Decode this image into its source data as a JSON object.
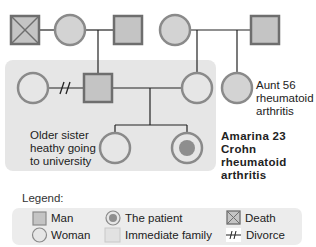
{
  "colors": {
    "fill": "#d3d3d3",
    "stroke": "#8a8a8a",
    "dark_stroke": "#6e6e6e",
    "line": "#222222",
    "family_box": "#e6e6e6",
    "legend_box": "#ececec",
    "patient_dot": "#8e8e8e"
  },
  "diagram": {
    "generation1": {
      "paternal_grandfather": {
        "sex": "male",
        "status": "deceased",
        "icon": "square-x-icon"
      },
      "paternal_grandmother": {
        "sex": "female",
        "icon": "circle-icon"
      },
      "paternal_step_grandfather": {
        "sex": "male",
        "icon": "square-icon"
      },
      "maternal_grandmother": {
        "sex": "female",
        "icon": "circle-icon"
      },
      "maternal_grandfather": {
        "sex": "male",
        "icon": "square-icon"
      }
    },
    "generation2": {
      "fathers_ex_partner": {
        "sex": "female",
        "icon": "circle-icon"
      },
      "divorce_mark": "//",
      "father": {
        "sex": "male",
        "icon": "square-icon"
      },
      "mother": {
        "sex": "female",
        "icon": "circle-icon"
      },
      "aunt": {
        "sex": "female",
        "icon": "circle-icon",
        "label_lines": [
          "Aunt 56",
          "rheumatoid",
          "arthritis"
        ]
      }
    },
    "generation3": {
      "older_sister": {
        "sex": "female",
        "icon": "circle-icon",
        "label_lines": [
          "Older sister",
          "heathy going",
          "to university"
        ]
      },
      "patient": {
        "sex": "female",
        "icon": "patient-circle-icon",
        "label_lines": [
          "Amarina 23",
          "Crohn",
          "rheumatoid",
          "arthritis"
        ]
      }
    }
  },
  "legend": {
    "title": "Legend:",
    "items": [
      {
        "label": "Man",
        "icon": "square-icon"
      },
      {
        "label": "Woman",
        "icon": "circle-icon"
      },
      {
        "label": "The patient",
        "icon": "patient-circle-icon"
      },
      {
        "label": "Immediate family",
        "icon": "family-box-icon"
      },
      {
        "label": "Death",
        "icon": "square-x-icon"
      },
      {
        "label": "Divorce",
        "icon": "divorce-icon"
      }
    ]
  }
}
